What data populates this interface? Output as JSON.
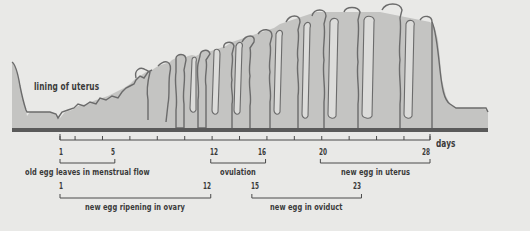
{
  "diagram": {
    "lining_label": "lining of uterus",
    "axis": {
      "unit_label": "days",
      "start_day": 1,
      "end_day": 28,
      "tick_every": 2
    },
    "phases": [
      {
        "id": "menstrual",
        "label": "old egg leaves in menstrual flow",
        "start": 1,
        "end": 5,
        "row": 1
      },
      {
        "id": "ovulation",
        "label": "ovulation",
        "start": 12,
        "end": 16,
        "row": 1
      },
      {
        "id": "uterus",
        "label": "new egg in uterus",
        "start": 20,
        "end": 28,
        "row": 1
      },
      {
        "id": "ovary",
        "label": "new egg ripening in ovary",
        "start": 1,
        "end": 12,
        "row": 2
      },
      {
        "id": "oviduct",
        "label": "new egg in oviduct",
        "start": 15,
        "end": 23,
        "row": 2
      }
    ],
    "colors": {
      "background": "#e9e9e7",
      "lining_fill": "#c4c4c2",
      "lining_stroke": "#6b6b6b",
      "gland_fill": "#dcdcda",
      "baseline": "#5a5a5a",
      "text": "#3a3a3a"
    }
  }
}
